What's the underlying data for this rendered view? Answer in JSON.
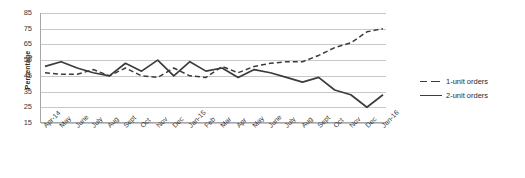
{
  "chart_data": {
    "type": "line",
    "title": "",
    "xlabel": "",
    "ylabel": "Percentage",
    "ylim": [
      15,
      85
    ],
    "ytick_step": 10,
    "yticks": [
      85,
      75,
      65,
      55,
      45,
      35,
      25,
      15
    ],
    "grid": true,
    "legend_position": "right",
    "categories": [
      "Apr-14",
      "May",
      "June",
      "July",
      "Aug",
      "Sept",
      "Oct",
      "Nov",
      "Dec",
      "Jan-15",
      "Feb",
      "Mar",
      "Apr",
      "May",
      "June",
      "July",
      "Aug",
      "Sept",
      "Oct",
      "Nov",
      "Dec",
      "Jan-16"
    ],
    "series": [
      {
        "name": "1-unit orders",
        "style": "dashed",
        "color": "#3c3c3c",
        "values": [
          47,
          46,
          46,
          49,
          45,
          50,
          45,
          44,
          50,
          45,
          44,
          51,
          47,
          51,
          53,
          54,
          54,
          58,
          63,
          66,
          73,
          75
        ]
      },
      {
        "name": "2-unit orders",
        "style": "solid",
        "color": "#3c3c3c",
        "values": [
          51,
          54,
          50,
          47,
          45,
          53,
          48,
          55,
          45,
          54,
          48,
          50,
          44,
          49,
          47,
          44,
          41,
          44,
          36,
          33,
          25,
          33
        ]
      }
    ]
  },
  "legend": {
    "items": [
      {
        "label": "1-unit orders",
        "style": "dashed"
      },
      {
        "label": "2-unit orders",
        "style": "solid"
      }
    ]
  }
}
